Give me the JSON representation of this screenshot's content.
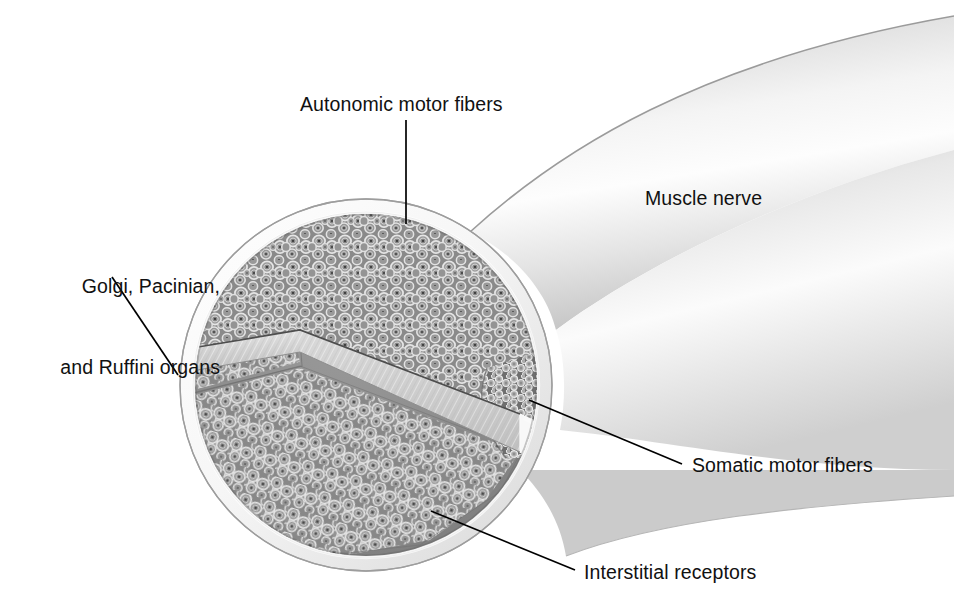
{
  "figure": {
    "background_color": "#ffffff",
    "text_color": "#111111"
  },
  "labels": {
    "autonomic": {
      "text": "Autonomic motor fibers",
      "x": 300,
      "y": 91,
      "leader": {
        "x1": 406,
        "y1": 120,
        "x2": 406,
        "y2": 224
      }
    },
    "golgi": {
      "line1": "Golgi, Pacinian,",
      "line2": "and Ruffini organs",
      "x": 28,
      "y": 219,
      "leader": {
        "x1": 112,
        "y1": 277,
        "x2": 178,
        "y2": 375
      }
    },
    "muscle_nerve": {
      "text": "Muscle nerve",
      "x": 645,
      "y": 185,
      "leader": null
    },
    "somatic": {
      "text": "Somatic motor fibers",
      "x": 692,
      "y": 452,
      "leader": {
        "x1": 682,
        "y1": 464,
        "x2": 529,
        "y2": 400
      }
    },
    "interstitial": {
      "text": "Interstitial receptors",
      "x": 584,
      "y": 559,
      "leader": {
        "x1": 575,
        "y1": 570,
        "x2": 431,
        "y2": 511
      }
    }
  },
  "anatomy": {
    "cross_section": {
      "center_x": 366,
      "center_y": 385,
      "radius": 186,
      "sheath_label": "epineurium-rim",
      "sheath_color": "#fbfbfb",
      "sheath_outline": "#9a9a9a",
      "fascicle_fill": "#8d8d8d"
    },
    "regions": [
      {
        "name": "autonomic-fascicle",
        "fiber_size": "medium",
        "position": "upper"
      },
      {
        "name": "golgi-pacinian-ruffini-fascicle",
        "fiber_size": "medium",
        "position": "left-wedge"
      },
      {
        "name": "interstitial-fascicle",
        "fiber_size": "medium",
        "position": "lower"
      },
      {
        "name": "somatic-fascicle",
        "fiber_size": "small",
        "position": "right"
      }
    ],
    "septum": {
      "name": "perineurium-septum",
      "color_top": "#d9d9d9",
      "color_face": "#cdcdcd",
      "edge_color": "#ffffff"
    },
    "nerve_trunk": {
      "name": "muscle-nerve-trunk",
      "color_dark": "#b9b9b9",
      "color_light": "#fdfdfd",
      "direction": "upper-right"
    }
  }
}
